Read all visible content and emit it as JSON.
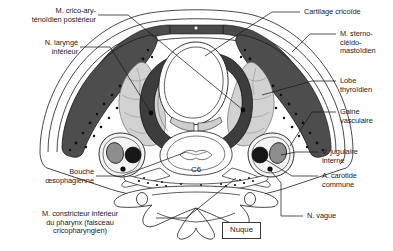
{
  "figure": {
    "title_box": "Nuque",
    "vertebra_label": "C6",
    "background_color": "#ffffff",
    "ink_color": "#1b1b1b",
    "muscle_fill": "#4a4a4a",
    "muscle_speckle": "#111111",
    "cartilage_fill": "#3d3d3d",
    "gland_fill": "#d2d2d2",
    "vein_fill": "#8d8d8d",
    "artery_fill": "#1a1a1a",
    "sheath_fill": "#f2f2f2"
  },
  "labels_left": [
    {
      "id": "crico-arytenoid-posterior",
      "text": "M. crico-ary-\nténoïdien postérieur"
    },
    {
      "id": "inferior-laryngeal-nerve",
      "text": "N. laryngé\ninférieur"
    },
    {
      "id": "esophageal-mouth",
      "text": "Bouche\nœsophagienne"
    },
    {
      "id": "inferior-pharyngeal-constrictor",
      "text": "M. constricteur inférieur\ndu pharynx (faisceau\ncricopharyngien)"
    }
  ],
  "labels_right": [
    {
      "id": "cricoid-cartilage",
      "text": "Cartilage cricoïde"
    },
    {
      "id": "sternocleidomastoid",
      "text": "M. sterno-\ncléido-\nmastoïdien"
    },
    {
      "id": "thyroid-lobe",
      "text": "Lobe\nthyroïdien"
    },
    {
      "id": "vascular-sheath",
      "text": "Gaine\nvasculaire"
    },
    {
      "id": "internal-jugular-vein",
      "text": "V. jugulaire\ninterne"
    },
    {
      "id": "common-carotid-artery",
      "text": "A. carotide\ncommune"
    },
    {
      "id": "vagus-nerve",
      "text": "N. vague"
    }
  ]
}
